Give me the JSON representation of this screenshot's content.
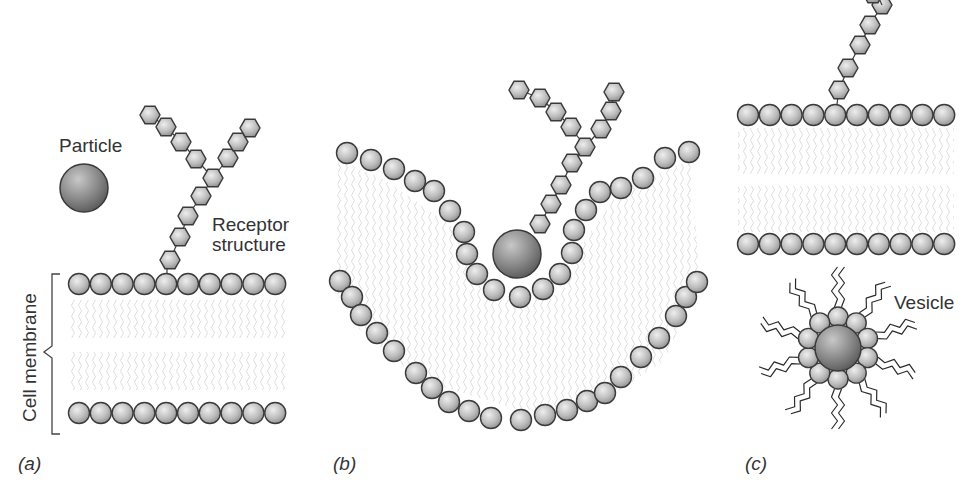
{
  "figure": {
    "panels": [
      {
        "id": "a",
        "label": "(a)"
      },
      {
        "id": "b",
        "label": "(b)"
      },
      {
        "id": "c",
        "label": "(c)"
      }
    ],
    "labels": {
      "particle": "Particle",
      "receptor_line1": "Receptor",
      "receptor_line2": "structure",
      "cell_membrane": "Cell membrane",
      "vesicle": "Vesicle"
    },
    "colors": {
      "bead_fill_light": "#e4e4e4",
      "bead_fill_dark": "#9a9a9a",
      "bead_stroke": "#3a3a3a",
      "particle_light": "#bdbdbd",
      "particle_dark": "#5e5e5e",
      "lipid_tail": "#d9d9d9",
      "vesicle_tail": "#2a2a2a",
      "text": "#333333"
    }
  }
}
